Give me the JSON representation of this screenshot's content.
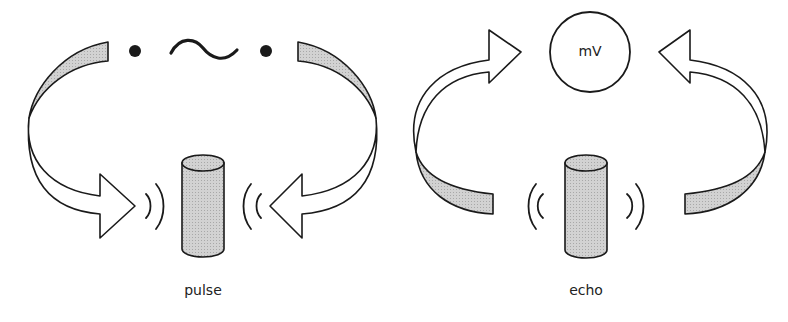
{
  "diagram": {
    "title": "",
    "panels": [
      {
        "id": "pulse",
        "label": "pulse",
        "elements": [
          "signal-source (dot, sine wave, dot)",
          "curved arrow left (toward transducer)",
          "curved arrow right (toward transducer)",
          "transducer cylinder",
          "waves emitted outward"
        ]
      },
      {
        "id": "echo",
        "label": "echo",
        "elements": [
          "meter circle labeled mV",
          "curved arrow left (toward meter)",
          "curved arrow right (toward meter)",
          "transducer cylinder",
          "waves received"
        ]
      }
    ],
    "meter_label": "mV",
    "colors": {
      "stroke": "#1a1a1a",
      "band_fill": "#c8c8c8",
      "cylinder_fill": "#cfcfcf",
      "arrow_fill": "#ffffff",
      "background": "#ffffff"
    }
  }
}
